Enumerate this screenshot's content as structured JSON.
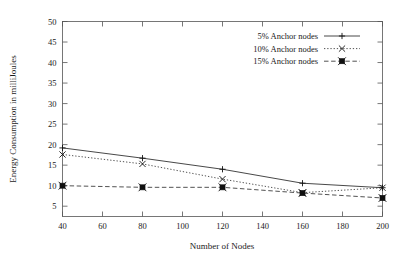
{
  "chart_data": {
    "type": "line",
    "title": "",
    "subtitle": "",
    "xlabel": "Number of Nodes",
    "ylabel": "Energy Consumption in milliJoules",
    "x": [
      40,
      80,
      120,
      160,
      200
    ],
    "xlim": [
      40,
      200
    ],
    "ylim": [
      0,
      50
    ],
    "xticks": [
      40,
      60,
      80,
      100,
      120,
      140,
      160,
      180,
      200
    ],
    "yticks": [
      5,
      10,
      15,
      20,
      25,
      30,
      35,
      40,
      45,
      50
    ],
    "grid": false,
    "legend_position": "top-right",
    "series": [
      {
        "name": "5% Anchor nodes",
        "values": [
          19.2,
          16.7,
          14.0,
          10.6,
          9.5
        ],
        "marker": "plus",
        "linestyle": "solid",
        "color": "#333333"
      },
      {
        "name": "10% Anchor nodes",
        "values": [
          17.6,
          15.3,
          11.6,
          8.3,
          9.5
        ],
        "marker": "cross",
        "linestyle": "dotted",
        "color": "#333333"
      },
      {
        "name": "15% Anchor nodes",
        "values": [
          10.0,
          9.6,
          9.6,
          8.2,
          7.0
        ],
        "marker": "filled-square",
        "linestyle": "dashed",
        "color": "#333333"
      }
    ]
  },
  "axes": {
    "x_tick_labels": [
      "40",
      "60",
      "80",
      "100",
      "120",
      "140",
      "160",
      "180",
      "200"
    ],
    "y_tick_labels": [
      "5",
      "10",
      "15",
      "20",
      "25",
      "30",
      "35",
      "40",
      "45",
      "50"
    ],
    "x_axis_title": "Number of Nodes",
    "y_axis_title": "Energy Consumption in milliJoules"
  },
  "legend": {
    "entries": [
      {
        "label": "5% Anchor nodes"
      },
      {
        "label": "10% Anchor nodes"
      },
      {
        "label": "15% Anchor nodes"
      }
    ]
  }
}
